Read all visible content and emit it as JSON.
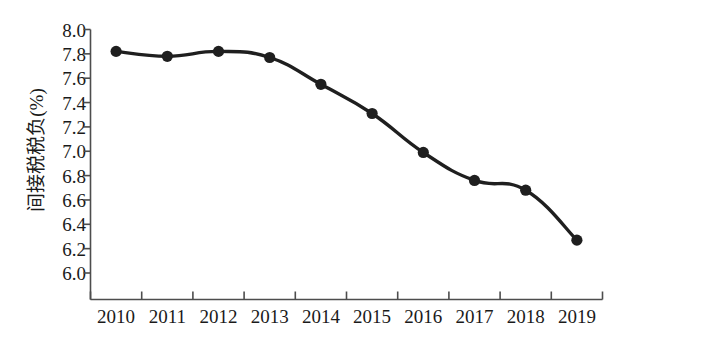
{
  "chart_data": {
    "type": "line",
    "title": "",
    "subtitle": "",
    "xlabel": "",
    "ylabel": "间接税税负(%)",
    "categories": [
      "2010",
      "2011",
      "2012",
      "2013",
      "2014",
      "2015",
      "2016",
      "2017",
      "2018",
      "2019"
    ],
    "values": [
      7.82,
      7.78,
      7.82,
      7.77,
      7.55,
      7.31,
      6.99,
      6.76,
      6.68,
      6.27
    ],
    "series": [
      {
        "name": "间接税税负",
        "values": [
          7.82,
          7.78,
          7.82,
          7.77,
          7.55,
          7.31,
          6.99,
          6.76,
          6.68,
          6.27
        ]
      }
    ],
    "ylim": [
      6.0,
      8.0
    ],
    "ytick_values": [
      6.0,
      6.2,
      6.4,
      6.6,
      6.8,
      7.0,
      7.2,
      7.4,
      7.6,
      7.8,
      8.0
    ],
    "ytick_labels": [
      "6.0",
      "6.2",
      "6.4",
      "6.6",
      "6.8",
      "7.0",
      "7.2",
      "7.4",
      "7.6",
      "7.8",
      "8.0"
    ],
    "xtick_labels": [
      "2010",
      "2011",
      "2012",
      "2013",
      "2014",
      "2015",
      "2016",
      "2017",
      "2018",
      "2019"
    ],
    "grid": false,
    "legend": false,
    "legend_position": "none",
    "line_color": "#1f1f1f",
    "marker_color": "#1f1f1f",
    "marker_shape": "circle",
    "axis_color": "#4d4d4d",
    "background_color": "#ffffff"
  },
  "axes": {
    "y_title": "间接税税负(%)"
  }
}
